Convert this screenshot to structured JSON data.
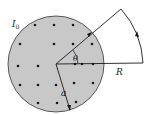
{
  "diagram": {
    "type": "physics-figure",
    "labels": {
      "current": "I",
      "current_subscript": "0",
      "angle": "θ",
      "outer_radius": "R",
      "inner_radius": "a"
    },
    "colors": {
      "disk_fill": "#c8c8c8",
      "disk_stroke": "#333333",
      "line": "#1a1a1a",
      "dot": "#1a1a1a"
    },
    "dots": [
      [
        35,
        25
      ],
      [
        54,
        25
      ],
      [
        73,
        25
      ],
      [
        20,
        40
      ],
      [
        35,
        40
      ],
      [
        54,
        44
      ],
      [
        73,
        44
      ],
      [
        92,
        44
      ],
      [
        18,
        64
      ],
      [
        38,
        64
      ],
      [
        75,
        64
      ],
      [
        82,
        64
      ],
      [
        92,
        64
      ],
      [
        20,
        84
      ],
      [
        38,
        84
      ],
      [
        56,
        84
      ],
      [
        73,
        84
      ],
      [
        92,
        84
      ],
      [
        35,
        102
      ],
      [
        56,
        102
      ],
      [
        75,
        102
      ]
    ]
  }
}
